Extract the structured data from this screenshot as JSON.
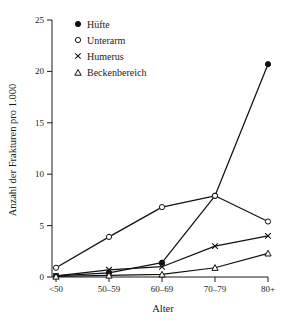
{
  "chart_data": {
    "type": "line",
    "title": "",
    "xlabel": "Alter",
    "ylabel": "Anzahl der Frakturen pro 1.000",
    "categories": [
      "<50",
      "50–59",
      "60–69",
      "70–79",
      "80+"
    ],
    "xticklabels": [
      "<50",
      "50–59",
      "60–69",
      "70–79",
      "80+"
    ],
    "yticklabels": [
      "0",
      "5",
      "10",
      "15",
      "20",
      "25"
    ],
    "ytickvalues": [
      0,
      5,
      10,
      15,
      20,
      25
    ],
    "ylim": [
      0,
      25
    ],
    "grid": false,
    "legend_position": "top-left inside",
    "series": [
      {
        "name": "Hüfte",
        "marker": "filled-circle",
        "values": [
          0.1,
          0.4,
          1.4,
          7.9,
          20.7
        ]
      },
      {
        "name": "Unterarm",
        "marker": "open-circle",
        "values": [
          0.9,
          3.9,
          6.8,
          7.9,
          5.4
        ]
      },
      {
        "name": "Humerus",
        "marker": "cross",
        "values": [
          0.1,
          0.7,
          1.0,
          3.0,
          4.0
        ]
      },
      {
        "name": "Beckenbereich",
        "marker": "open-triangle",
        "values": [
          0.05,
          0.15,
          0.25,
          0.9,
          2.3
        ]
      }
    ],
    "colors": {
      "line": "#111111",
      "axis": "#1a1a1a",
      "background": "#ffffff"
    }
  },
  "legend": {
    "items": [
      {
        "label": "Hüfte",
        "marker": "filled-circle"
      },
      {
        "label": "Unterarm",
        "marker": "open-circle"
      },
      {
        "label": "Humerus",
        "marker": "cross"
      },
      {
        "label": "Beckenbereich",
        "marker": "open-triangle"
      }
    ]
  }
}
